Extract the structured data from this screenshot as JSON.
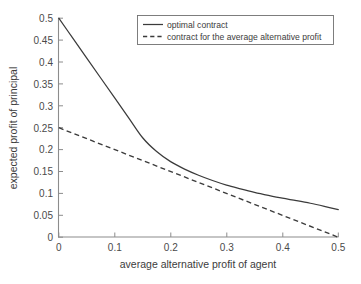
{
  "chart_data": {
    "type": "line",
    "title": "",
    "xlabel": "average alternative profit of agent",
    "ylabel": "expected profit of principal",
    "xlim": [
      0,
      0.5
    ],
    "ylim": [
      0,
      0.5
    ],
    "grid": false,
    "legend_position": "top-right",
    "xticks": [
      "0",
      "0.1",
      "0.2",
      "0.3",
      "0.4",
      "0.5"
    ],
    "xtick_values": [
      0,
      0.1,
      0.2,
      0.3,
      0.4,
      0.5
    ],
    "yticks": [
      "0",
      "0.05",
      "0.1",
      "0.15",
      "0.2",
      "0.25",
      "0.3",
      "0.35",
      "0.4",
      "0.45",
      "0.5"
    ],
    "ytick_values": [
      0,
      0.05,
      0.1,
      0.15,
      0.2,
      0.25,
      0.3,
      0.35,
      0.4,
      0.45,
      0.5
    ],
    "series": [
      {
        "name": "optimal contract",
        "style": "solid",
        "color": "#3b3b3b",
        "x": [
          0,
          0.025,
          0.05,
          0.075,
          0.1,
          0.125,
          0.15,
          0.175,
          0.2,
          0.225,
          0.25,
          0.275,
          0.3,
          0.325,
          0.35,
          0.375,
          0.4,
          0.425,
          0.45,
          0.475,
          0.5
        ],
        "values": [
          0.5,
          0.4545,
          0.409,
          0.3635,
          0.318,
          0.2725,
          0.227,
          0.1955,
          0.1725,
          0.1555,
          0.1415,
          0.1295,
          0.119,
          0.1105,
          0.1025,
          0.0955,
          0.089,
          0.0835,
          0.0775,
          0.0705,
          0.063
        ]
      },
      {
        "name": "contract for the average alternative profit",
        "style": "dashed",
        "color": "#3b3b3b",
        "x": [
          0,
          0.5
        ],
        "values": [
          0.25,
          0
        ]
      }
    ],
    "legend_entries": [
      {
        "label": "optimal contract",
        "style": "solid"
      },
      {
        "label": "contract for the average alternative profit",
        "style": "dashed"
      }
    ]
  }
}
